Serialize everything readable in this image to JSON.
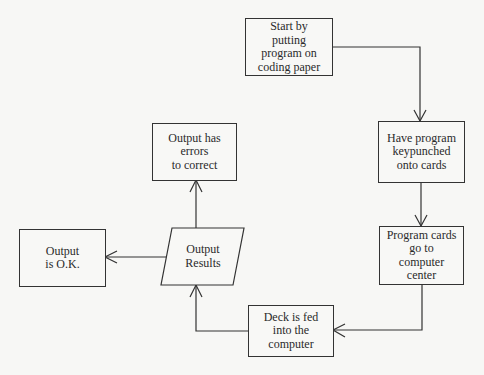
{
  "diagram": {
    "type": "flowchart",
    "nodes": [
      {
        "id": "start",
        "shape": "rectangle",
        "lines": [
          "Start by",
          "putting",
          "program on",
          "coding paper"
        ]
      },
      {
        "id": "keypunch",
        "shape": "rectangle",
        "lines": [
          "Have program",
          "keypunched",
          "onto cards"
        ]
      },
      {
        "id": "cards",
        "shape": "rectangle",
        "lines": [
          "Program cards",
          "go to",
          "computer",
          "center"
        ]
      },
      {
        "id": "deck",
        "shape": "rectangle",
        "lines": [
          "Deck is fed",
          "into the",
          "computer"
        ]
      },
      {
        "id": "output",
        "shape": "parallelogram",
        "lines": [
          "Output",
          "Results"
        ]
      },
      {
        "id": "errors",
        "shape": "rectangle",
        "lines": [
          "Output has",
          "errors",
          "to correct"
        ]
      },
      {
        "id": "ok",
        "shape": "rectangle",
        "lines": [
          "Output",
          "is O.K."
        ]
      }
    ],
    "edges": [
      {
        "from": "start",
        "to": "keypunch"
      },
      {
        "from": "keypunch",
        "to": "cards"
      },
      {
        "from": "cards",
        "to": "deck"
      },
      {
        "from": "deck",
        "to": "output"
      },
      {
        "from": "output",
        "to": "errors"
      },
      {
        "from": "output",
        "to": "ok"
      }
    ]
  }
}
